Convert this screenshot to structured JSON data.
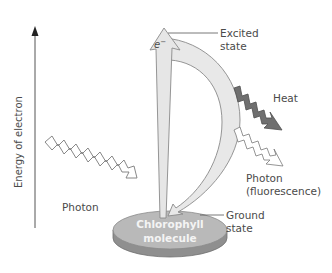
{
  "diagram": {
    "axis": {
      "label": "Energy of electron",
      "direction": "up"
    },
    "labels": {
      "photon_in": "Photon",
      "electron": "e",
      "electron_superscript": "−",
      "excited_state_line1": "Excited",
      "excited_state_line2": "state",
      "heat": "Heat",
      "photon_out_line1": "Photon",
      "photon_out_line2": "(fluorescence)",
      "ground_state_line1": "Ground",
      "ground_state_line2": "state",
      "molecule_line1": "Chlorophyll",
      "molecule_line2": "molecule"
    },
    "colors": {
      "disk_top": "#b9b9b9",
      "disk_side": "#8f8f8f",
      "arrow_fill": "#e6e6e6",
      "arrow_stroke": "#8a8a8a",
      "heat_fill": "#6f6f6f",
      "text": "#4a4a4a",
      "axis": "#555555"
    }
  }
}
